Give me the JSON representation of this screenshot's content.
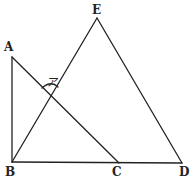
{
  "diagram": {
    "type": "geometry",
    "points": {
      "A": {
        "label": "A",
        "x": 12,
        "y": 57,
        "lx": 9,
        "ly": 51
      },
      "B": {
        "label": "B",
        "x": 12,
        "y": 162,
        "lx": 10,
        "ly": 175
      },
      "C": {
        "label": "C",
        "x": 119,
        "y": 163,
        "lx": 118,
        "ly": 175
      },
      "D": {
        "label": "D",
        "x": 182,
        "y": 163,
        "lx": 185,
        "ly": 175
      },
      "E": {
        "label": "E",
        "x": 97,
        "y": 18,
        "lx": 98,
        "ly": 14
      }
    },
    "segments": [
      "AB",
      "AC",
      "BD",
      "BE",
      "ED"
    ],
    "angle_mark": {
      "label": "ア",
      "at": "intersection of AC and BE",
      "x": 51,
      "y": 96
    }
  }
}
